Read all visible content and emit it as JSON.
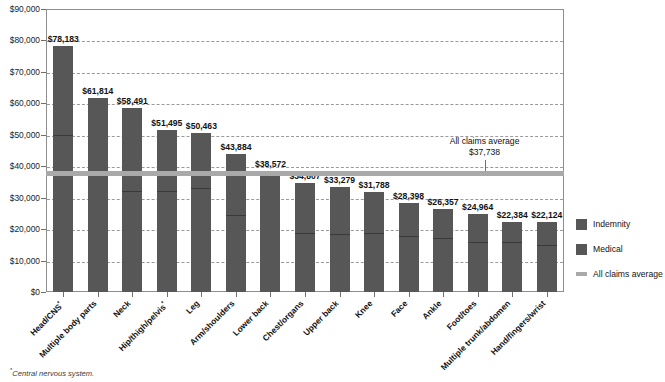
{
  "chart_data": {
    "type": "bar",
    "title": "",
    "subtitle": "",
    "xlabel": "",
    "ylabel": "",
    "ylim": [
      0,
      90000
    ],
    "ytick_step": 10000,
    "ytick_labels": [
      "$90,000",
      "$80,000",
      "$70,000",
      "$60,000",
      "$50,000",
      "$40,000",
      "$30,000",
      "$20,000",
      "$10,000",
      "$0"
    ],
    "ytick_values": [
      90000,
      80000,
      70000,
      60000,
      50000,
      40000,
      30000,
      20000,
      10000,
      0
    ],
    "grid": "horizontal-dashed",
    "stacked": true,
    "legend_position": "right",
    "categories": [
      "Head/CNS*",
      "Multiple body parts",
      "Neck",
      "Hip/thigh/pelvis*",
      "Leg",
      "Arm/shoulders",
      "Lower back",
      "Chest/organs",
      "Upper back",
      "Knee",
      "Face",
      "Ankle",
      "Foot/toes",
      "Multiple trunk/abdomen",
      "Hand/fingers/wrist"
    ],
    "totals": [
      78183,
      61814,
      58491,
      51495,
      50463,
      43884,
      38572,
      34807,
      33279,
      31788,
      28398,
      26357,
      24964,
      22384,
      22124
    ],
    "total_labels": [
      "$78,183",
      "$61,814",
      "$58,491",
      "$51,495",
      "$50,463",
      "$43,884",
      "$38,572",
      "$34,807",
      "$33,279",
      "$31,788",
      "$28,398",
      "$26,357",
      "$24,964",
      "$22,384",
      "$22,124"
    ],
    "series": [
      {
        "name": "Medical",
        "values": [
          49500,
          37000,
          31700,
          31700,
          32800,
          24100,
          38572,
          18300,
          18000,
          18300,
          17500,
          16900,
          15600,
          15600,
          14600
        ]
      },
      {
        "name": "Indemnity",
        "values": [
          28683,
          24814,
          26791,
          19795,
          17663,
          19784,
          0,
          16507,
          15279,
          13488,
          10898,
          9457,
          9364,
          6784,
          7524
        ]
      }
    ],
    "reference_line": {
      "label": "All claims average",
      "value": 37738,
      "value_label": "$37,738",
      "color": "#a9a9a9"
    },
    "legend_entries": [
      {
        "label": "Indemnity",
        "color": "#575757",
        "style": "swatch"
      },
      {
        "label": "Medical",
        "color": "#575757",
        "style": "swatch"
      },
      {
        "label": "All claims average",
        "color": "#a9a9a9",
        "style": "line"
      }
    ]
  },
  "footnote": {
    "marker": "*",
    "text": "Central nervous system."
  },
  "colors": {
    "bar": "#575757",
    "average_line": "#a9a9a9",
    "grid": "#9a9a9a",
    "frame": "#8e8e8e",
    "text": "#121212",
    "background": "#ffffff"
  }
}
